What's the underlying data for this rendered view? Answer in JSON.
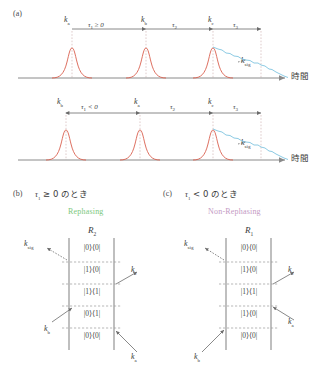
{
  "figure": {
    "panel_a": {
      "tag": "(a)",
      "axis_label": "時間",
      "rows": [
        {
          "id": "row-tau1-positive",
          "pulse_labels": [
            "k",
            "k",
            "k"
          ],
          "pulse_subs": [
            "a",
            "b",
            "c"
          ],
          "intervals": [
            {
              "symbol": "τ",
              "sub": "1",
              "relation": " ≥ 0"
            },
            {
              "symbol": "τ",
              "sub": "2",
              "relation": ""
            },
            {
              "symbol": "τ",
              "sub": "3",
              "relation": ""
            }
          ],
          "signal_label": "k",
          "signal_sub": "sig"
        },
        {
          "id": "row-tau1-negative",
          "pulse_labels": [
            "k",
            "k",
            "k"
          ],
          "pulse_subs": [
            "b",
            "a",
            "c"
          ],
          "intervals": [
            {
              "symbol": "τ",
              "sub": "1",
              "relation": " < 0"
            },
            {
              "symbol": "τ",
              "sub": "2",
              "relation": ""
            },
            {
              "symbol": "τ",
              "sub": "3",
              "relation": ""
            }
          ],
          "signal_label": "k",
          "signal_sub": "sig"
        }
      ]
    },
    "panel_b": {
      "tag": "(b)",
      "condition_symbol": "τ",
      "condition_sub": "1",
      "condition_rest": " ≥ 0 のとき",
      "kind_label": "Rephasing",
      "kind_color": "#7dc87d",
      "diagram_name": "R",
      "diagram_sub": "2",
      "states": [
        "|0⟩⟨0|",
        "|1⟩⟨0|",
        "|1⟩⟨1|",
        "|0⟩⟨1|",
        "|0⟩⟨0|"
      ],
      "arrows": [
        {
          "name": "k-sig",
          "label": "k",
          "sub": "sig"
        },
        {
          "name": "k-c",
          "label": "k",
          "sub": "c"
        },
        {
          "name": "k-b",
          "label": "k",
          "sub": "b"
        },
        {
          "name": "k-a",
          "label": "k",
          "sub": "a"
        }
      ]
    },
    "panel_c": {
      "tag": "(c)",
      "condition_symbol": "τ",
      "condition_sub": "1",
      "condition_rest": " < 0 のとき",
      "kind_label": "Non-Rephasing",
      "kind_color": "#c49ac4",
      "diagram_name": "R",
      "diagram_sub": "1",
      "states": [
        "|0⟩⟨0|",
        "|1⟩⟨0|",
        "|1⟩⟨1|",
        "|1⟩⟨0|",
        "|0⟩⟨0|"
      ],
      "arrows": [
        {
          "name": "k-sig",
          "label": "k",
          "sub": "sig"
        },
        {
          "name": "k-c",
          "label": "k",
          "sub": "c"
        },
        {
          "name": "k-a",
          "label": "k",
          "sub": "a"
        },
        {
          "name": "k-b",
          "label": "k",
          "sub": "b"
        }
      ]
    },
    "colors": {
      "pulse": "#d9604f",
      "signal": "#7fc4e0",
      "axis": "#8a8a8a"
    }
  }
}
